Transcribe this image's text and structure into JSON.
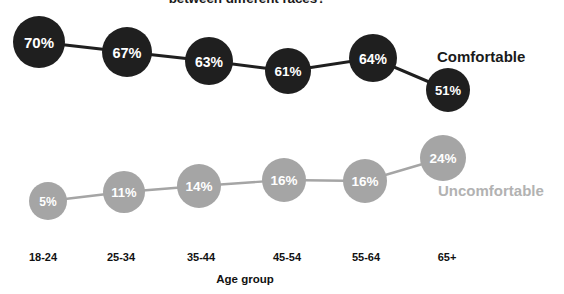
{
  "chart_data": {
    "type": "scatter",
    "title": "between different races?",
    "xlabel": "Age group",
    "ylabel": "",
    "grid": false,
    "legend_position": "right-inline",
    "categories": [
      "18-24",
      "25-34",
      "35-44",
      "45-54",
      "55-64",
      "65+"
    ],
    "series": [
      {
        "name": "Comfortable",
        "color": "#1f1f1f",
        "label_color": "#1a1a1a",
        "values": [
          70,
          67,
          63,
          61,
          64,
          51
        ],
        "value_labels": [
          "70%",
          "67%",
          "63%",
          "61%",
          "64%",
          "51%"
        ],
        "points": [
          {
            "cx": 39,
            "cy": 42,
            "r": 26,
            "font": 15
          },
          {
            "cx": 127,
            "cy": 52,
            "r": 25,
            "font": 14.5
          },
          {
            "cx": 209,
            "cy": 61,
            "r": 24,
            "font": 14
          },
          {
            "cx": 288,
            "cy": 71,
            "r": 23,
            "font": 13.5
          },
          {
            "cx": 373,
            "cy": 58,
            "r": 24,
            "font": 14
          },
          {
            "cx": 448,
            "cy": 90,
            "r": 22,
            "font": 13
          }
        ],
        "legend_x": 437,
        "legend_y": 56
      },
      {
        "name": "Uncomfortable",
        "color": "#a5a5a5",
        "label_color": "#b2b2b2",
        "values": [
          5,
          11,
          14,
          16,
          16,
          24
        ],
        "value_labels": [
          "5%",
          "11%",
          "14%",
          "16%",
          "16%",
          "24%"
        ],
        "points": [
          {
            "cx": 48,
            "cy": 201,
            "r": 19,
            "font": 12
          },
          {
            "cx": 124,
            "cy": 192,
            "r": 21,
            "font": 13
          },
          {
            "cx": 199,
            "cy": 186,
            "r": 22,
            "font": 13.5
          },
          {
            "cx": 284,
            "cy": 180,
            "r": 22,
            "font": 13.5
          },
          {
            "cx": 365,
            "cy": 181,
            "r": 22,
            "font": 13.5
          },
          {
            "cx": 443,
            "cy": 158,
            "r": 23,
            "font": 13.5
          }
        ],
        "legend_x": 438,
        "legend_y": 190
      }
    ],
    "tick_positions": [
      43,
      121,
      201,
      287,
      366,
      447
    ],
    "tick_y": 251,
    "axis_title_x": 245,
    "axis_title_y": 273
  }
}
